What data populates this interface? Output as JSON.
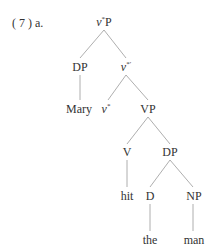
{
  "example_label": "( 7 ) a.",
  "tree": {
    "root": {
      "base": "v",
      "sup": "*",
      "tail": "P"
    },
    "nodes": {
      "dp1": "DP",
      "vbar": {
        "base": "v",
        "sup": "*′"
      },
      "mary": "Mary",
      "vstar": {
        "base": "v",
        "sup": "*"
      },
      "vp": "VP",
      "v": "V",
      "dp2": "DP",
      "hit": "hit",
      "d": "D",
      "np": "NP",
      "the": "the",
      "man": "man"
    }
  }
}
